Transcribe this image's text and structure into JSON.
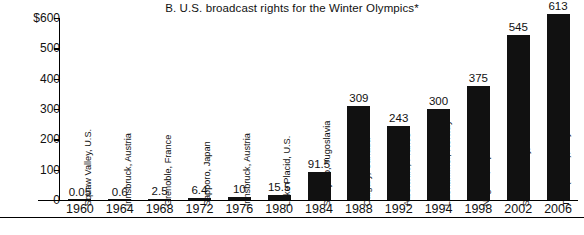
{
  "chart_data": {
    "type": "bar",
    "title": "B.  U.S. broadcast rights for the Winter Olympics*",
    "xlabel": "",
    "ylabel": "",
    "ylim": [
      0,
      600
    ],
    "grid": false,
    "legend": "none",
    "y_ticks": [
      "0",
      "100",
      "200",
      "300",
      "400",
      "500",
      "$600"
    ],
    "y_tick_values": [
      0,
      100,
      200,
      300,
      400,
      500,
      600
    ],
    "categories": [
      "1960",
      "1964",
      "1968",
      "1972",
      "1976",
      "1980",
      "1984",
      "1988",
      "1992",
      "1994",
      "1998",
      "2002",
      "2006"
    ],
    "values": [
      0.05,
      0.6,
      2.5,
      6.4,
      10,
      15.5,
      91.5,
      309,
      243,
      300,
      375,
      545,
      613
    ],
    "value_labels": [
      "0.05",
      "0.6",
      "2.5",
      "6.4",
      "10",
      "15.5",
      "91.5",
      "309",
      "243",
      "300",
      "375",
      "545",
      "613"
    ],
    "point_labels": [
      "Squaw Valley, U.S.",
      "Innsbruck, Austria",
      "Grenoble, France",
      "Sapporo, Japan",
      "Innsbruck, Austria",
      "Lake Placid, U.S.",
      "Sarajevo, Yugoslavia",
      "Calgary, Canada",
      "Albertville, France",
      "Lillehammer, Norway",
      "Nagano, Japan",
      "Salt Lake City, U.S.",
      "Turin(Torino), Italy"
    ],
    "bar_color": "#111111",
    "background_color": "#ffffff"
  }
}
